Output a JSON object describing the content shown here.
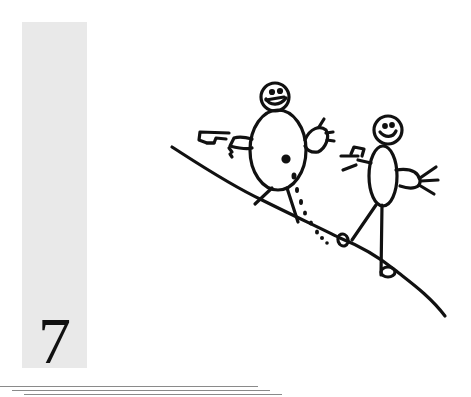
{
  "page": {
    "number": "7",
    "sidebar_color": "#e9e9e9",
    "ink_color": "#111111"
  },
  "illustration": {
    "description": "Child's drawing of two stick figures walking down a slope",
    "figures": [
      {
        "name": "left-figure",
        "holding": "gun-shaped object",
        "feature": "dotted trail from body to ground"
      },
      {
        "name": "right-figure",
        "holding": "small object in hand"
      }
    ],
    "ground": "diagonal hill line"
  },
  "rules": [
    {
      "x1": 0,
      "x2": 258,
      "y": 386
    },
    {
      "x1": 12,
      "x2": 270,
      "y": 390
    },
    {
      "x1": 24,
      "x2": 282,
      "y": 394
    }
  ]
}
